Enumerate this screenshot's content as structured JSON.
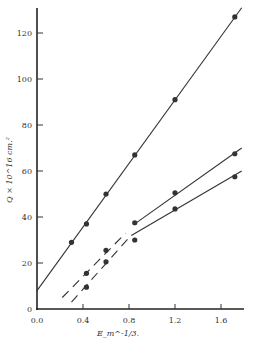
{
  "chart_data": {
    "type": "scatter",
    "title": "",
    "xlabel": "E_m^-1/3.",
    "ylabel": "Q × 10^16 cm.²",
    "xlim": [
      -0.02,
      1.8
    ],
    "ylim": [
      0,
      130
    ],
    "xticks": [
      0.0,
      0.4,
      0.8,
      1.2,
      1.6
    ],
    "xtick_labels": [
      "0.0",
      "0.4",
      "0.8",
      "1.2",
      "1.6"
    ],
    "yticks": [
      0,
      20,
      40,
      60,
      80,
      100,
      120
    ],
    "ytick_labels": [
      "0",
      "20",
      "40",
      "60",
      "80",
      "100",
      "120"
    ],
    "grid": false,
    "legend": "none",
    "series": [
      {
        "name": "upper",
        "points": [
          [
            0.3,
            29
          ],
          [
            0.43,
            37
          ],
          [
            0.6,
            50
          ],
          [
            0.85,
            67
          ],
          [
            1.2,
            91
          ],
          [
            1.72,
            127
          ]
        ],
        "fit_line": {
          "from": [
            0.0,
            8
          ],
          "to": [
            1.78,
            131
          ]
        },
        "dashed_segment": null
      },
      {
        "name": "middle",
        "points": [
          [
            0.43,
            15.5
          ],
          [
            0.6,
            25.5
          ],
          [
            0.85,
            37.5
          ],
          [
            1.2,
            50.5
          ],
          [
            1.72,
            67.5
          ]
        ],
        "fit_line": {
          "from": [
            0.85,
            37
          ],
          "to": [
            1.78,
            70
          ]
        },
        "dashed_segment": {
          "from": [
            0.22,
            5
          ],
          "to": [
            0.77,
            33
          ]
        }
      },
      {
        "name": "lower",
        "points": [
          [
            0.43,
            9.5
          ],
          [
            0.6,
            20.5
          ],
          [
            0.85,
            30
          ],
          [
            1.2,
            43.5
          ],
          [
            1.72,
            57.5
          ]
        ],
        "fit_line": {
          "from": [
            0.82,
            32
          ],
          "to": [
            1.78,
            60
          ]
        },
        "dashed_segment": {
          "from": [
            0.3,
            3
          ],
          "to": [
            0.8,
            31
          ]
        }
      }
    ]
  }
}
